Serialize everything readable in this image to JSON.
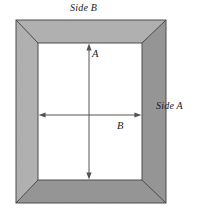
{
  "figure": {
    "background_color": "#ffffff",
    "frame": {
      "fill_color": "#a9a9a9",
      "stroke_color": "#4d4d4d",
      "outer": {
        "x": 16,
        "y": 20,
        "width": 150,
        "height": 183
      },
      "inner": {
        "x": 38,
        "y": 43,
        "width": 104,
        "height": 137
      },
      "miter_lines": 4,
      "texture": "fine-hatch"
    },
    "labels": {
      "side_b": "Side B",
      "side_a": "Side A",
      "dimension_a": "A",
      "dimension_b": "B"
    },
    "arrows": {
      "stroke_color": "#555555",
      "vertical": {
        "name": "dimension-a-arrow",
        "x": 89,
        "y1": 44,
        "y2": 179,
        "double_headed": true,
        "measures": "A"
      },
      "horizontal": {
        "name": "dimension-b-arrow",
        "y": 115,
        "x1": 39,
        "x2": 141,
        "double_headed": true,
        "measures": "B"
      }
    }
  }
}
